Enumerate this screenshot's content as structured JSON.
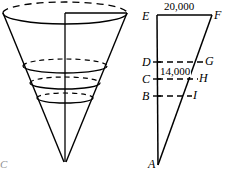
{
  "figure": {
    "title_visible": false,
    "stroke_color": "#000000",
    "background_color": "#ffffff",
    "cone": {
      "description": "inverted-cone-with-horizontal-cross-section-ellipses",
      "top_ellipse": {
        "cx": 65,
        "cy": 13,
        "rx": 62,
        "ry": 11
      },
      "apex": {
        "x": 65,
        "y": 162
      },
      "axis_line": {
        "x1": 65,
        "y1": 13,
        "x2": 65,
        "y2": 162
      },
      "radius_line": {
        "x1": 65,
        "y1": 13,
        "x2": 127,
        "y2": 13
      },
      "cross_sections": [
        {
          "cx": 65,
          "cy": 66,
          "rx": 42,
          "ry": 7
        },
        {
          "cx": 65,
          "cy": 83,
          "rx": 35,
          "ry": 6
        },
        {
          "cx": 65,
          "cy": 98,
          "rx": 28,
          "ry": 5
        }
      ],
      "edge_label": "C"
    },
    "triangle": {
      "description": "cross-section-triangle-with-parallel-chords",
      "apex_label": "A",
      "apex_point": {
        "x": 158,
        "y": 165
      },
      "vertical_side": {
        "x1": 157,
        "y1": 15,
        "x2": 158,
        "y2": 165
      },
      "slant_side": {
        "x1": 212,
        "y1": 15,
        "x2": 158,
        "y2": 165
      },
      "top_chord_label_left": "E",
      "top_chord_label_right": "F",
      "levels": [
        {
          "left_label": "D",
          "right_label": "G",
          "y": 62,
          "right_x": 203
        },
        {
          "left_label": "C",
          "right_label": "H",
          "y": 79,
          "right_x": 197
        },
        {
          "left_label": "B",
          "right_label": "I",
          "y": 96,
          "right_x": 191
        }
      ],
      "measurements": [
        {
          "text": "20,000",
          "position": "top",
          "x": 183,
          "y": 7
        },
        {
          "text": "14,000",
          "position": "mid",
          "x": 178,
          "y": 71
        }
      ]
    }
  }
}
